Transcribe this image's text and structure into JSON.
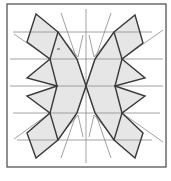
{
  "figure": {
    "type": "geometric-tessellation",
    "colors": {
      "frame": "#555555",
      "shape_fill": "#e6e6e6",
      "shape_stroke": "#3a3a3a",
      "construction_line": "#8a8a8a",
      "background": "#ffffff"
    },
    "frame": {
      "x": 7,
      "y": 4,
      "width": 159,
      "height": 163
    },
    "horizontal_lines_y": [
      32,
      59,
      86,
      113,
      140
    ],
    "vertical_center_x": 86,
    "shapes": [
      {
        "name": "top-left-parallelogram",
        "points": "36,14 58,32 50,59 27,42"
      },
      {
        "name": "top-right-parallelogram",
        "points": "135,15 143,43 122,59 114,32"
      },
      {
        "name": "bottom-left-parallelogram",
        "points": "50,113 27,133 36,158 58,140"
      },
      {
        "name": "bottom-right-parallelogram",
        "points": "122,113 143,133 135,158 114,140"
      },
      {
        "name": "left-upper-triangle",
        "points": "50,59 27,78 57,86"
      },
      {
        "name": "left-lower-triangle",
        "points": "57,86 27,96 50,113"
      },
      {
        "name": "right-upper-triangle",
        "points": "122,59 145,78 115,86"
      },
      {
        "name": "right-lower-triangle",
        "points": "115,86 145,96 122,113"
      },
      {
        "name": "left-body",
        "points": "58,32 77,59 86,86 77,113 58,140 50,113 57,86 50,59"
      },
      {
        "name": "right-body",
        "points": "114,32 122,59 115,86 122,113 114,140 95,113 86,86 95,59"
      }
    ]
  }
}
